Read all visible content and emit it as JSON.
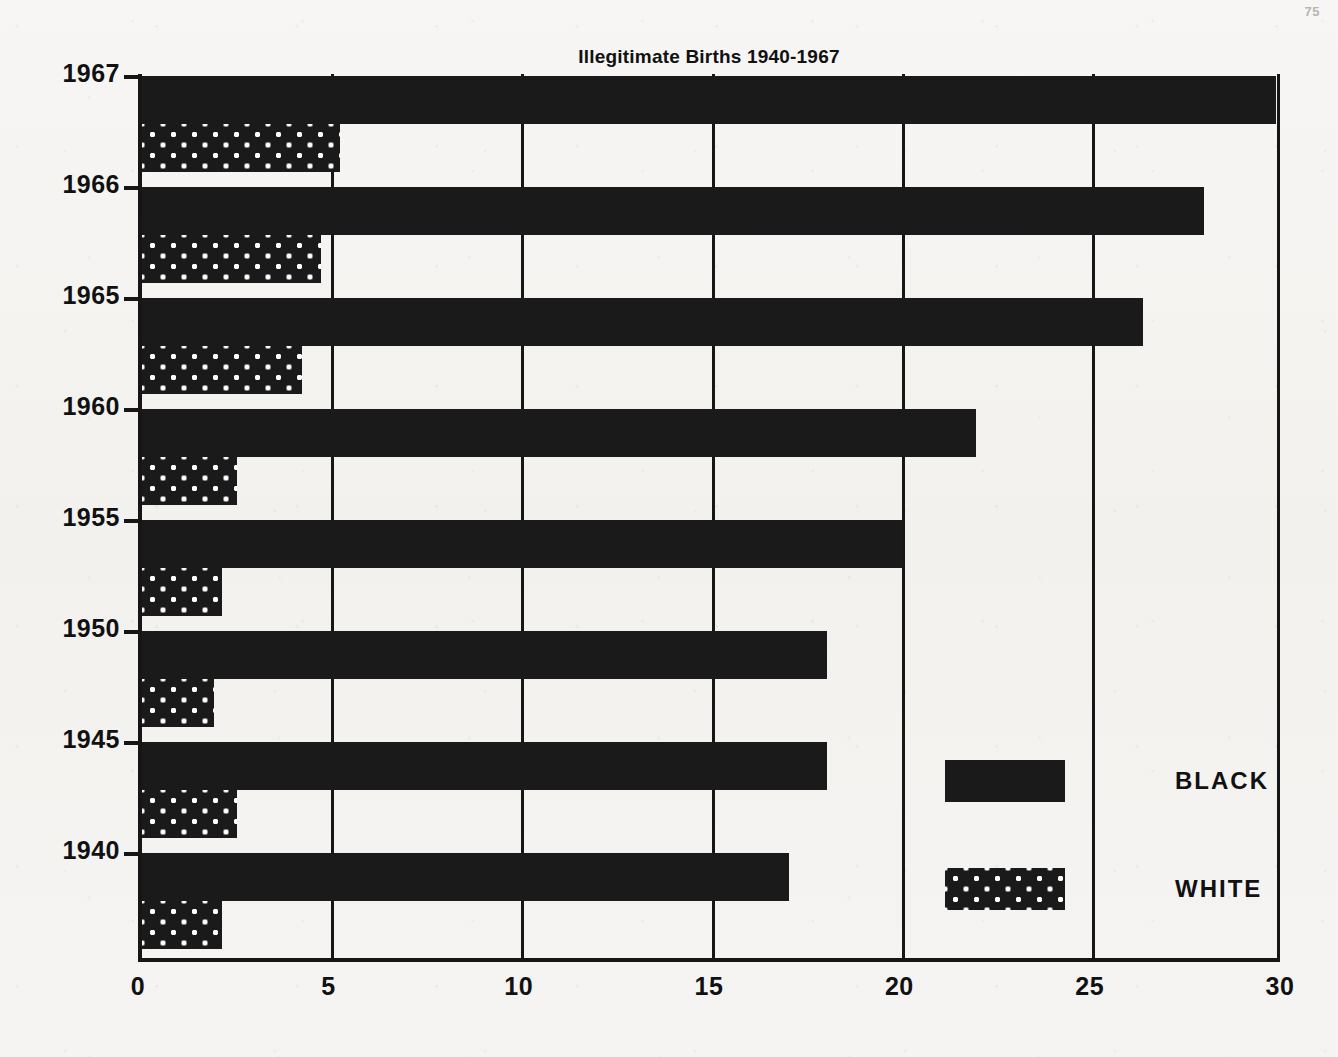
{
  "page_number": "75",
  "chart_data": {
    "type": "bar",
    "orientation": "horizontal",
    "title": "Illegitimate Births 1940-1967",
    "xlabel": "",
    "ylabel": "",
    "xlim": [
      0,
      30
    ],
    "xticks": [
      "0",
      "5",
      "10",
      "15",
      "20",
      "25",
      "30"
    ],
    "xtick_values": [
      0,
      5,
      10,
      15,
      20,
      25,
      30
    ],
    "grid": true,
    "grid_axis": "x",
    "legend_position": "inside-right",
    "categories": [
      "1940",
      "1945",
      "1950",
      "1955",
      "1960",
      "1965",
      "1966",
      "1967"
    ],
    "category_order_top_to_bottom": [
      "1967",
      "1966",
      "1965",
      "1960",
      "1955",
      "1950",
      "1945",
      "1940"
    ],
    "series": [
      {
        "name": "BLACK",
        "pattern": "solid",
        "values": [
          17.0,
          18.0,
          18.0,
          20.0,
          21.9,
          26.3,
          27.9,
          29.8
        ]
      },
      {
        "name": "WHITE",
        "pattern": "dotted",
        "values": [
          2.1,
          2.5,
          1.9,
          2.1,
          2.5,
          4.2,
          4.7,
          5.2
        ]
      }
    ]
  },
  "legend": {
    "items": [
      {
        "label": "BLACK",
        "pattern": "solid"
      },
      {
        "label": "WHITE",
        "pattern": "dotted"
      }
    ]
  },
  "colors": {
    "ink": "#1a1a1a",
    "paper": "#f4f3f1"
  }
}
